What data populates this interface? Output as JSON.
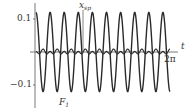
{
  "chart_data": {
    "type": "line",
    "title": "",
    "xlabel": "t",
    "ylabel": "",
    "x_range": [
      0,
      6.2832
    ],
    "ylim": [
      -0.13,
      0.13
    ],
    "grid": false,
    "legend": "none (inline curve labels)",
    "x_ticks": [
      {
        "value": 6.2832,
        "label": "2π"
      }
    ],
    "y_ticks": [
      {
        "value": 0.1,
        "label": "0.1"
      },
      {
        "value": -0.1,
        "label": "-0.1"
      }
    ],
    "series": [
      {
        "name": "F1",
        "label": "F₁",
        "kind": "sinusoid",
        "amplitude": 0.12,
        "cycles": 9.5,
        "description": "large-amplitude oscillation about zero"
      },
      {
        "name": "x_sp",
        "label": "x_sp",
        "kind": "small oscillation",
        "amplitude": 0.01,
        "cycles": 9.5,
        "description": "small-amplitude oscillation near zero line"
      }
    ],
    "annotations": [
      {
        "text": "x_sp",
        "at": "top, pointing to small curve"
      },
      {
        "text": "F₁",
        "at": "bottom, near trough"
      },
      {
        "text": "2π",
        "at": "end of t-axis"
      },
      {
        "text": "t",
        "at": "horizontal axis label"
      }
    ]
  },
  "labels": {
    "y_tick_pos": "0.1",
    "y_tick_neg": "−0.1",
    "x_end": "2π",
    "x_axis": "t",
    "curve_small_main": "x",
    "curve_small_sub": "sp",
    "curve_big_main": "F",
    "curve_big_sub": "1"
  },
  "colors": {
    "curve": "#2a2a2a",
    "axis": "#444444",
    "text": "#333333"
  }
}
